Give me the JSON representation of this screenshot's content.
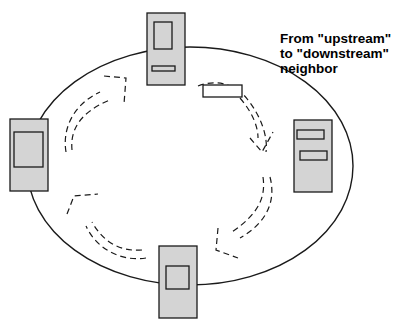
{
  "diagram": {
    "type": "token-ring",
    "caption": {
      "lines": [
        "From \"upstream\"",
        "to \"downstream\"",
        "neighbor"
      ]
    },
    "nodes": [
      {
        "id": "top",
        "kind": "station",
        "position": "top"
      },
      {
        "id": "right",
        "kind": "station",
        "position": "right"
      },
      {
        "id": "bottom",
        "kind": "station",
        "position": "bottom"
      },
      {
        "id": "left",
        "kind": "station",
        "position": "left"
      }
    ],
    "arrows": [
      {
        "from": "top",
        "to": "right",
        "style": "dashed",
        "carries": "token-frame"
      },
      {
        "from": "right",
        "to": "bottom",
        "style": "dashed"
      },
      {
        "from": "bottom",
        "to": "left",
        "style": "dashed"
      },
      {
        "from": "left",
        "to": "top",
        "style": "dashed"
      }
    ],
    "direction": "clockwise",
    "colors": {
      "node_fill": "#d4d4d4",
      "stroke": "#1a1a1a",
      "background": "#ffffff"
    }
  }
}
